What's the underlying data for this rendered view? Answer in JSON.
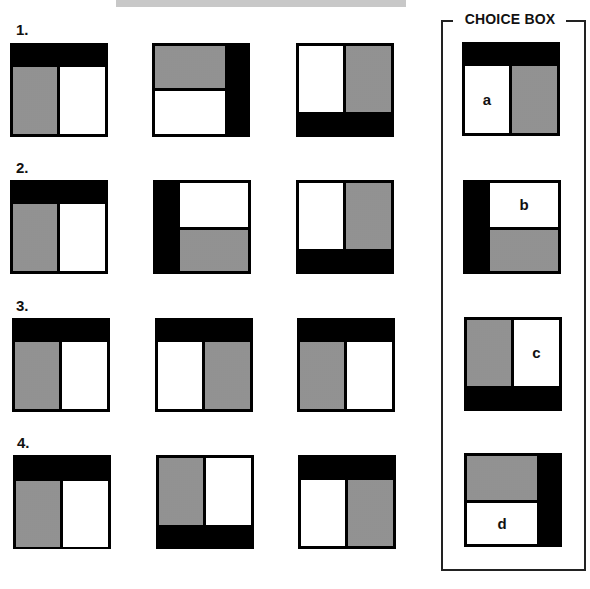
{
  "choice_box": {
    "title": "CHOICE BOX",
    "options": [
      {
        "letter": "a",
        "layout": "black-top / white-left, gray-right"
      },
      {
        "letter": "b",
        "layout": "black-left / white-top, gray-bottom"
      },
      {
        "letter": "c",
        "layout": "black-bottom / gray-left, white-right"
      },
      {
        "letter": "d",
        "layout": "black-right / gray-top, white-bottom"
      }
    ]
  },
  "rows": [
    {
      "label": "1.",
      "figures": [
        "black-top / gray-left, white-right",
        "black-right / gray-top, white-bottom",
        "black-bottom / white-left, gray-right"
      ]
    },
    {
      "label": "2.",
      "figures": [
        "black-top / gray-left, white-right",
        "black-left / white-top, gray-bottom",
        "black-bottom / white-left, gray-right"
      ]
    },
    {
      "label": "3.",
      "figures": [
        "black-top / gray-left, white-right",
        "black-top / white-left, gray-right",
        "black-top / gray-left, white-right"
      ]
    },
    {
      "label": "4.",
      "figures": [
        "black-top / gray-left, white-right",
        "black-bottom / gray-left, white-right",
        "black-top / white-left, gray-right"
      ]
    }
  ],
  "colors": {
    "black": "#000000",
    "gray_fill": "#c9c9c9",
    "white": "#ffffff"
  }
}
